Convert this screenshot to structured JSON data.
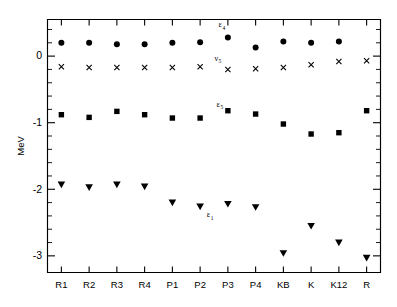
{
  "chart_data": {
    "type": "scatter",
    "title": "",
    "xlabel": "",
    "ylabel": "MeV",
    "categories": [
      "R1",
      "R2",
      "R3",
      "R4",
      "P1",
      "P2",
      "P3",
      "P4",
      "KB",
      "K",
      "K12",
      "R"
    ],
    "ylim": [
      -3.25,
      0.55
    ],
    "yticks": [
      0,
      -1,
      -2,
      -3
    ],
    "ytick_labels": [
      "0",
      "-1",
      "-2",
      "-3"
    ],
    "y_minor_per_interval": 4,
    "grid": false,
    "legend": "none",
    "series": [
      {
        "name": "filled-circle",
        "marker": "circle",
        "values": [
          0.2,
          0.2,
          0.18,
          0.18,
          0.2,
          0.21,
          0.28,
          0.13,
          0.22,
          0.2,
          0.22,
          null
        ]
      },
      {
        "name": "cross",
        "marker": "x",
        "values": [
          -0.16,
          -0.17,
          -0.17,
          -0.17,
          -0.17,
          -0.16,
          -0.2,
          -0.19,
          -0.17,
          -0.13,
          -0.08,
          -0.07
        ]
      },
      {
        "name": "filled-square",
        "marker": "square",
        "values": [
          -0.88,
          -0.92,
          -0.83,
          -0.88,
          -0.93,
          -0.93,
          -0.82,
          -0.87,
          -1.02,
          -1.17,
          -1.15,
          -0.82
        ]
      },
      {
        "name": "filled-triangle-down",
        "marker": "triangle-down",
        "values": [
          -1.93,
          -1.97,
          -1.93,
          -1.96,
          -2.2,
          -2.26,
          -2.22,
          -2.27,
          -2.96,
          -2.55,
          -2.8,
          -3.03
        ]
      }
    ],
    "annotations": [
      {
        "id": "annot-eps-4",
        "base": "ε",
        "sub": "4",
        "x_category": "P3",
        "x_offset": -6,
        "y": 0.43
      },
      {
        "id": "annot-nu-5",
        "base": "ν",
        "sub": "5",
        "x_category": "P3",
        "x_offset": -10,
        "y": -0.07
      },
      {
        "id": "annot-eps-5",
        "base": "ε",
        "sub": "5",
        "x_category": "P3",
        "x_offset": -8,
        "y": -0.76
      },
      {
        "id": "annot-eps-1",
        "base": "ε",
        "sub": "1",
        "x_category": "P2",
        "x_offset": 10,
        "y": -2.42
      }
    ]
  },
  "figure": {
    "ylabel": "MeV",
    "background_color": "#ffffff",
    "ink_color": "#000000"
  }
}
